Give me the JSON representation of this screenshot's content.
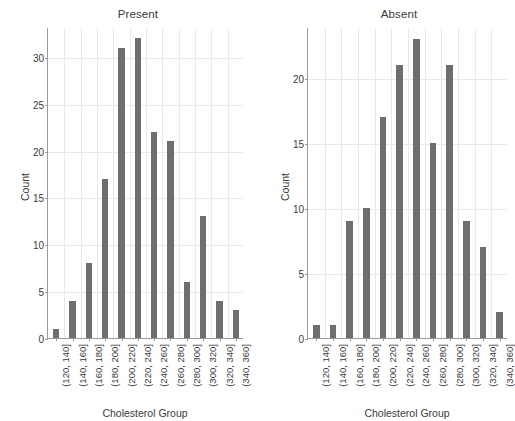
{
  "figure": {
    "background_color": "#ffffff",
    "bar_color": "#6e6e6e",
    "grid_color": "#e9e9e9",
    "axis_color": "#9a9a9a",
    "text_color": "#3a3a3a"
  },
  "chart_data": [
    {
      "type": "bar",
      "title": "Present",
      "xlabel": "Cholesterol Group",
      "ylabel": "Count",
      "categories": [
        "(120, 140]",
        "(140, 160]",
        "(160, 180]",
        "(180, 200]",
        "(200, 220]",
        "(220, 240]",
        "(240, 260]",
        "(260, 280]",
        "(280, 300]",
        "(300, 320]",
        "(320, 340]",
        "(340, 360]"
      ],
      "values": [
        1,
        4,
        8,
        17,
        31,
        32,
        22,
        21,
        6,
        13,
        4,
        3
      ],
      "yticks": [
        0,
        5,
        10,
        15,
        20,
        25,
        30
      ],
      "ylim": [
        0,
        33.2
      ],
      "grid": true,
      "legend": "none"
    },
    {
      "type": "bar",
      "title": "Absent",
      "xlabel": "Cholesterol Group",
      "ylabel": "Count",
      "categories": [
        "(120, 140]",
        "(140, 160]",
        "(160, 180]",
        "(180, 200]",
        "(200, 220]",
        "(220, 240]",
        "(240, 260]",
        "(260, 280]",
        "(280, 300]",
        "(300, 320]",
        "(320, 340]",
        "(340, 360]"
      ],
      "values": [
        1,
        1,
        9,
        10,
        17,
        21,
        23,
        15,
        21,
        9,
        7,
        2
      ],
      "yticks": [
        0,
        5,
        10,
        15,
        20
      ],
      "ylim": [
        0,
        23.9
      ],
      "grid": true,
      "legend": "none"
    }
  ]
}
